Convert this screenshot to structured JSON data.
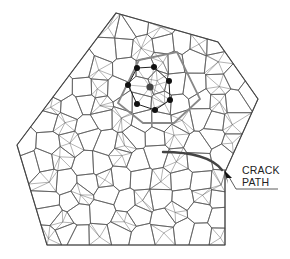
{
  "diagram": {
    "type": "voronoi-mesh",
    "colors": {
      "mesh_line": "#555555",
      "highlight_line": "#888888",
      "node": "#111111",
      "center_node": "#444444",
      "crack": "#444444"
    },
    "outer_boundary": [
      [
        116,
        13
      ],
      [
        218,
        42
      ],
      [
        258,
        99
      ],
      [
        225,
        172
      ],
      [
        225,
        245
      ],
      [
        47,
        245
      ],
      [
        17,
        145
      ]
    ],
    "highlighted_element": [
      [
        139,
        60
      ],
      [
        177,
        52
      ],
      [
        200,
        99
      ],
      [
        174,
        123
      ],
      [
        143,
        123
      ],
      [
        118,
        103
      ]
    ],
    "node_ring": [
      [
        137,
        68
      ],
      [
        154,
        67
      ],
      [
        169,
        81
      ],
      [
        170,
        100
      ],
      [
        155,
        110
      ],
      [
        137,
        104
      ],
      [
        128,
        85
      ]
    ],
    "center_node": [
      150,
      87
    ],
    "crack_path": "M163 152 Q 208 152 222 170",
    "annotation": {
      "line1": "CRACK",
      "line2": "PATH"
    }
  }
}
